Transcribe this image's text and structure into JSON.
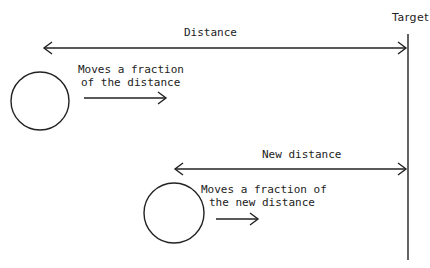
{
  "diagram": {
    "target_label": "Target",
    "distance_label": "Distance",
    "new_distance_label": "New distance",
    "step1_caption": [
      "Moves a fraction",
      "of the distance"
    ],
    "step2_caption": [
      "Moves a fraction of",
      "the new distance"
    ],
    "stroke_color": "#222222",
    "background": "#ffffff"
  }
}
